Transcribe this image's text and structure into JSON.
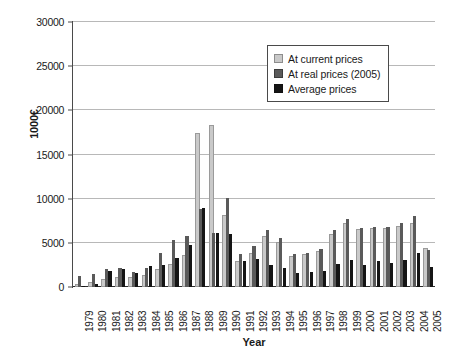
{
  "chart_data": {
    "type": "bar",
    "title": "",
    "xlabel": "Year",
    "ylabel": "1000€",
    "ylim": [
      0,
      30000
    ],
    "ytick_labels": [
      "0",
      "5000",
      "10000",
      "15000",
      "20000",
      "25000",
      "30000"
    ],
    "ytick_values": [
      0,
      5000,
      10000,
      15000,
      20000,
      25000,
      30000
    ],
    "grid": true,
    "legend_position": "top-right",
    "categories": [
      "1979",
      "1980",
      "1981",
      "1982",
      "1983",
      "1984",
      "1985",
      "1986",
      "1987",
      "1988",
      "1989",
      "1990",
      "1991",
      "1992",
      "1993",
      "1994",
      "1995",
      "1996",
      "1997",
      "1998",
      "1999",
      "2000",
      "2001",
      "2002",
      "2003",
      "2004",
      "2005"
    ],
    "series": [
      {
        "name": "At current prices",
        "color": "#c9c9c9",
        "values": [
          150,
          330,
          700,
          900,
          900,
          1100,
          1800,
          2400,
          3400,
          17200,
          18100,
          7900,
          2700,
          3600,
          5500,
          4900,
          3300,
          3500,
          3900,
          5800,
          7000,
          6300,
          6400,
          6500,
          6700,
          7000,
          4200
        ]
      },
      {
        "name": "At real prices (2005)",
        "color": "#5a5a5a",
        "values": [
          1250,
          1450,
          2050,
          2150,
          1650,
          2150,
          3900,
          5300,
          5750,
          8850,
          6150,
          10100,
          3700,
          4650,
          6450,
          5550,
          3700,
          3900,
          4300,
          6400,
          7700,
          6650,
          6750,
          6850,
          7200,
          8000,
          4200
        ]
      },
      {
        "name": "Average prices",
        "color": "#151515",
        "values": [
          130,
          350,
          1800,
          2000,
          1600,
          2350,
          2500,
          3300,
          4800,
          8900,
          6150,
          6000,
          3000,
          3150,
          2450,
          2100,
          1550,
          1650,
          1850,
          2600,
          3050,
          2500,
          2900,
          2750,
          3100,
          3800,
          2250
        ]
      }
    ]
  },
  "legend": {
    "items": [
      {
        "label": "At current prices",
        "key": "s-current"
      },
      {
        "label": "At real prices (2005)",
        "key": "s-real"
      },
      {
        "label": "Average prices",
        "key": "s-average"
      }
    ]
  }
}
